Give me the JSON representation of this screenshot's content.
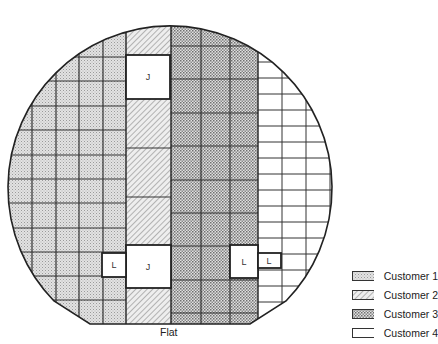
{
  "diagram": {
    "flat_label": "Flat",
    "marks": {
      "j_top": "J",
      "j_bottom": "J",
      "l_left": "L",
      "l_right_1": "L",
      "l_right_2": "L"
    }
  },
  "legend": {
    "items": [
      {
        "label": "Customer 1",
        "pattern": "fine-dots-light"
      },
      {
        "label": "Customer 2",
        "pattern": "diagonal-hatch"
      },
      {
        "label": "Customer 3",
        "pattern": "checker-dots-dark"
      },
      {
        "label": "Customer 4",
        "pattern": "blank"
      }
    ]
  },
  "colors": {
    "outline": "#222222",
    "customer1_fill": "#d9d9d9",
    "customer2_fill": "#e6e6e6",
    "customer3_fill": "#cfcfcf",
    "customer4_fill": "#ffffff"
  }
}
